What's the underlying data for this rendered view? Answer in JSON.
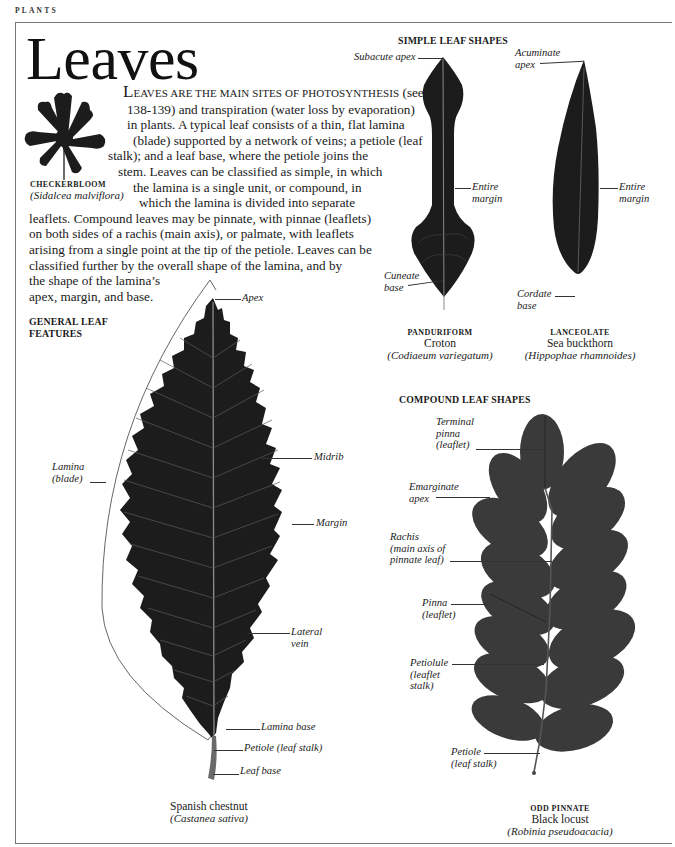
{
  "header": {
    "section": "PLANTS",
    "title": "Leaves"
  },
  "intro": {
    "lines": [
      {
        "dropcap": "L",
        "smallcaps": "EAVES ARE THE MAIN SITES OF PHOTOSYNTHESIS",
        "rest": " (see pp."
      },
      {
        "text": "138-139) and transpiration (water loss by evaporation)"
      },
      {
        "text": "in plants. A typical leaf consists of a thin, flat lamina"
      },
      {
        "text": "(blade) supported by a network of veins; a petiole (leaf"
      },
      {
        "text": "stalk); and a leaf base, where the petiole joins the"
      },
      {
        "text": "stem. Leaves can be classified as simple, in which"
      },
      {
        "text": "the lamina is a single unit, or compound, in"
      },
      {
        "text": "which the lamina is divided into separate"
      },
      {
        "text": "leaflets. Compound leaves may be pinnate, with pinnae (leaflets)"
      },
      {
        "text": "on both sides of a rachis (main axis), or palmate, with leaflets"
      },
      {
        "text": "arising from a single point at the tip of the petiole. Leaves can be"
      },
      {
        "text": "classified further by the overall shape of the lamina, and by"
      },
      {
        "text": "the shape of the lamina’s"
      },
      {
        "text": "apex, margin, and base."
      }
    ]
  },
  "checkerbloom": {
    "common_name": "CHECKERBLOOM",
    "scientific_name": "(Sidalcea malviflora)"
  },
  "general_features": {
    "heading_line1": "GENERAL LEAF",
    "heading_line2": "FEATURES",
    "labels": {
      "apex": "Apex",
      "midrib": "Midrib",
      "margin": "Margin",
      "lamina_line1": "Lamina",
      "lamina_line2": "(blade)",
      "lateral_vein_line1": "Lateral",
      "lateral_vein_line2": "vein",
      "lamina_base": "Lamina base",
      "petiole": "Petiole (leaf stalk)",
      "leaf_base": "Leaf base"
    },
    "caption": {
      "common_name": "Spanish chestnut",
      "scientific_name": "(Castanea sativa)"
    }
  },
  "simple_shapes": {
    "heading": "SIMPLE LEAF SHAPES",
    "panduriform": {
      "labels": {
        "apex": "Subacute apex",
        "margin_line1": "Entire",
        "margin_line2": "margin",
        "base_line1": "Cuneate",
        "base_line2": "base"
      },
      "caption": {
        "type": "PANDURIFORM",
        "common_name": "Croton",
        "scientific_name": "(Codiaeum variegatum)"
      }
    },
    "lanceolate": {
      "labels": {
        "apex_line1": "Acuminate",
        "apex_line2": "apex",
        "margin_line1": "Entire",
        "margin_line2": "margin",
        "base_line1": "Cordate",
        "base_line2": "base"
      },
      "caption": {
        "type": "LANCEOLATE",
        "common_name": "Sea buckthorn",
        "scientific_name": "(Hippophae rhamnoides)"
      }
    }
  },
  "compound_shapes": {
    "heading": "COMPOUND LEAF SHAPES",
    "labels": {
      "terminal_line1": "Terminal",
      "terminal_line2": "pinna",
      "terminal_line3": "(leaflet)",
      "emarginate_line1": "Emarginate",
      "emarginate_line2": "apex",
      "rachis_line1": "Rachis",
      "rachis_line2": "(main axis of",
      "rachis_line3": "pinnate leaf)",
      "pinna_line1": "Pinna",
      "pinna_line2": "(leaflet)",
      "petiolule_line1": "Petiolule",
      "petiolule_line2": "(leaflet",
      "petiolule_line3": "stalk)",
      "petiole_line1": "Petiole",
      "petiole_line2": "(leaf stalk)"
    },
    "caption": {
      "type": "ODD PINNATE",
      "common_name": "Black locust",
      "scientific_name": "(Robinia pseudoacacia)"
    }
  },
  "colors": {
    "leaf_dark": "#1c1c1c",
    "leaf_compound": "#3a3a3a",
    "vein": "#9a9a9a",
    "frame": "#777777"
  }
}
